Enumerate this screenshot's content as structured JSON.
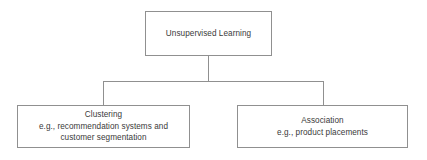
{
  "diagram": {
    "type": "tree",
    "orientation": "top-down",
    "style": {
      "border_color": "#909090",
      "text_color": "#3a3a3a",
      "background_color": "#ffffff"
    },
    "nodes": {
      "root": {
        "lines": [
          "Unsupervised Learning"
        ]
      },
      "clustering": {
        "lines": [
          "Clustering",
          "e.g., recommendation systems and",
          "customer segmentation"
        ]
      },
      "association": {
        "lines": [
          "Association",
          "e.g., product placements"
        ]
      }
    },
    "edges": [
      {
        "from": "root",
        "to": "clustering"
      },
      {
        "from": "root",
        "to": "association"
      }
    ]
  }
}
